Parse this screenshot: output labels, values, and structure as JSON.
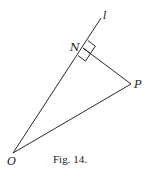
{
  "figure": {
    "caption": "Fig. 14.",
    "points": {
      "O": {
        "label": "O",
        "x": 13,
        "y": 153
      },
      "N": {
        "label": "N",
        "x": 83,
        "y": 48
      },
      "P": {
        "label": "P",
        "x": 131,
        "y": 84
      }
    },
    "line": {
      "label": "l",
      "from": "O",
      "through": "N",
      "end": {
        "x": 101,
        "y": 18
      }
    },
    "segments": [
      {
        "from": "O",
        "to": "P"
      },
      {
        "from": "N",
        "to": "P"
      }
    ],
    "right_angle_at": "N",
    "colors": {
      "stroke": "#2a2a2a",
      "text": "#222222",
      "background": "#ffffff"
    }
  }
}
